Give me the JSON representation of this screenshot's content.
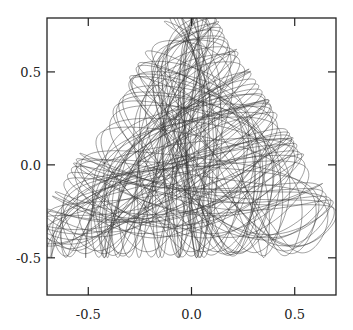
{
  "chart_data": {
    "type": "line",
    "title": "",
    "xlabel": "",
    "ylabel": "",
    "xlim": [
      -0.7,
      0.7
    ],
    "ylim": [
      -0.7,
      0.79
    ],
    "grid": false,
    "legend": null,
    "x_ticks": [
      {
        "value": -0.5,
        "label": "-0.5"
      },
      {
        "value": 0.0,
        "label": "0.0"
      },
      {
        "value": 0.5,
        "label": "0.5"
      }
    ],
    "y_ticks": [
      {
        "value": -0.5,
        "label": "-0.5"
      },
      {
        "value": 0.0,
        "label": "0.0"
      },
      {
        "value": 0.5,
        "label": "0.5"
      }
    ],
    "series": [
      {
        "name": "orbit",
        "description": "Trajectory of a chaotic/quasi-periodic orbit in a triangular (Henon-Heiles-like) potential, filling a rounded-triangle region",
        "envelope": {
          "apex": [
            0.0,
            0.66
          ],
          "bottom_y": -0.44,
          "left_x": -0.57,
          "right_x": 0.61
        },
        "color": "#333333",
        "line_width": 0.6,
        "integration": {
          "energy": 0.1666,
          "x0": 0.0,
          "y0": -0.1,
          "py0_sign": 1,
          "dt": 0.01,
          "steps": 60000
        }
      }
    ]
  }
}
